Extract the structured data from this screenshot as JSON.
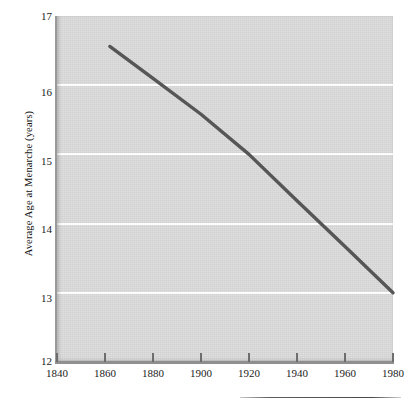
{
  "chart_data": {
    "type": "line",
    "title": "",
    "xlabel": "",
    "ylabel": "Average Age at Menarche (years)",
    "xlim": [
      1840,
      1980
    ],
    "ylim": [
      12,
      17
    ],
    "grid": true,
    "legend": "none",
    "x_ticks": [
      1840,
      1860,
      1880,
      1900,
      1920,
      1940,
      1960,
      1980
    ],
    "y_ticks": [
      12,
      13,
      14,
      15,
      16,
      17
    ],
    "series": [
      {
        "name": "Average age at menarche",
        "color": "#565656",
        "x": [
          1862,
          1880,
          1900,
          1920,
          1940,
          1960,
          1980
        ],
        "values": [
          16.56,
          16.1,
          15.58,
          15.0,
          14.33,
          13.67,
          13.0
        ]
      }
    ],
    "annotations": []
  },
  "axes": {
    "y_title": "Average Age at Menarche (years)",
    "y_tick_labels": [
      "17",
      "16",
      "15",
      "14",
      "13",
      "12"
    ],
    "x_tick_labels": [
      "1840",
      "1860",
      "1880",
      "1900",
      "1920",
      "1940",
      "1960",
      "1980"
    ]
  },
  "style": {
    "plot_background": "#d9d9d9",
    "gridline_color": "#fdfdfd",
    "line_color": "#565656",
    "axis_color": "#8f8f8f",
    "text_color": "#1b1b1b",
    "page_background": "#ffffff"
  }
}
